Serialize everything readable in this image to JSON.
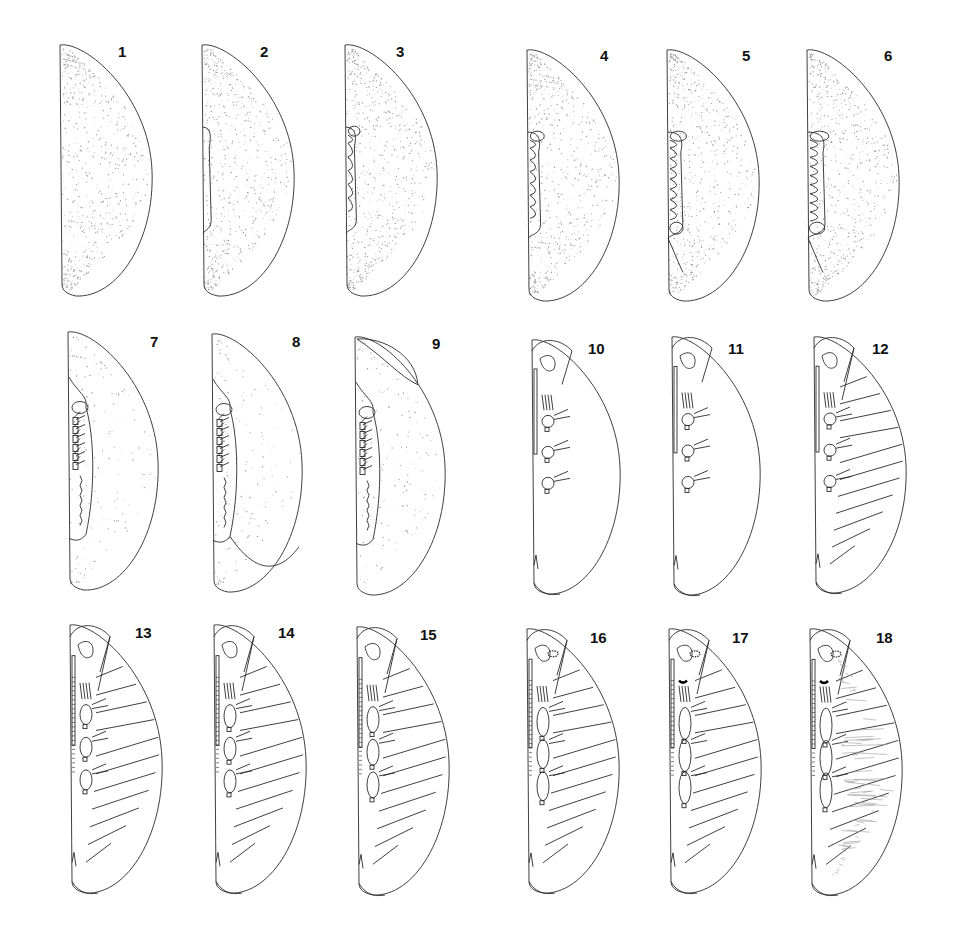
{
  "plate": {
    "description": "Plate of 18 embryonic developmental stages in lateral view",
    "rows": 3,
    "columns": 6,
    "colors": {
      "line": "#2a2a2a",
      "stipple": "#9a9a9a",
      "background": "#ffffff"
    }
  },
  "figures": [
    {
      "label": "1",
      "stage": "egg, uniform yolk",
      "x": 48,
      "y": 43,
      "w": 106,
      "h": 255,
      "type": "egg",
      "band": 0
    },
    {
      "label": "2",
      "stage": "early germ band",
      "x": 190,
      "y": 43,
      "w": 106,
      "h": 255,
      "type": "egg",
      "band": 1
    },
    {
      "label": "3",
      "stage": "segmenting germ band",
      "x": 333,
      "y": 43,
      "w": 106,
      "h": 255,
      "type": "egg",
      "band": 2
    },
    {
      "label": "4",
      "stage": "germ band with segment folds",
      "x": 515,
      "y": 48,
      "w": 106,
      "h": 255,
      "type": "egg",
      "band": 3
    },
    {
      "label": "5",
      "stage": "limb buds appearing",
      "x": 655,
      "y": 48,
      "w": 106,
      "h": 255,
      "type": "egg",
      "band": 4
    },
    {
      "label": "6",
      "stage": "limb buds elongating",
      "x": 795,
      "y": 48,
      "w": 106,
      "h": 255,
      "type": "egg",
      "band": 5
    },
    {
      "label": "7",
      "stage": "appendages forming",
      "x": 56,
      "y": 330,
      "w": 104,
      "h": 262,
      "type": "mid",
      "band": 6
    },
    {
      "label": "8",
      "stage": "appendages segmented",
      "x": 200,
      "y": 332,
      "w": 104,
      "h": 262,
      "type": "mid",
      "band": 7
    },
    {
      "label": "9",
      "stage": "dorsal closure begins",
      "x": 343,
      "y": 335,
      "w": 104,
      "h": 262,
      "type": "mid",
      "band": 8
    },
    {
      "label": "10",
      "stage": "appendages outlined, yolk clear",
      "x": 520,
      "y": 338,
      "w": 102,
      "h": 258,
      "type": "late",
      "band": 9
    },
    {
      "label": "11",
      "stage": "head capsule defined",
      "x": 660,
      "y": 335,
      "w": 102,
      "h": 262,
      "type": "late",
      "band": 10
    },
    {
      "label": "12",
      "stage": "tergites segmented",
      "x": 802,
      "y": 335,
      "w": 106,
      "h": 260,
      "type": "segmented",
      "band": 11
    },
    {
      "label": "13",
      "stage": "antenna segmented",
      "x": 58,
      "y": 623,
      "w": 106,
      "h": 272,
      "type": "segmented",
      "band": 12
    },
    {
      "label": "14",
      "stage": "antenna elongated",
      "x": 202,
      "y": 623,
      "w": 106,
      "h": 272,
      "type": "segmented",
      "band": 13
    },
    {
      "label": "15",
      "stage": "legs elongated",
      "x": 345,
      "y": 625,
      "w": 106,
      "h": 272,
      "type": "segmented",
      "band": 14
    },
    {
      "label": "16",
      "stage": "eye pigment appearing",
      "x": 515,
      "y": 627,
      "w": 106,
      "h": 268,
      "type": "segmented",
      "band": 15
    },
    {
      "label": "17",
      "stage": "eye and mandible pigmented",
      "x": 657,
      "y": 627,
      "w": 106,
      "h": 268,
      "type": "segmented",
      "band": 16
    },
    {
      "label": "18",
      "stage": "pre-hatching, setae visible",
      "x": 798,
      "y": 627,
      "w": 106,
      "h": 270,
      "type": "segmented",
      "band": 17
    }
  ],
  "labels": {
    "1": {
      "x": 118,
      "y": 44
    },
    "2": {
      "x": 260,
      "y": 44
    },
    "3": {
      "x": 396,
      "y": 44
    },
    "4": {
      "x": 600,
      "y": 48
    },
    "5": {
      "x": 742,
      "y": 48
    },
    "6": {
      "x": 884,
      "y": 48
    },
    "7": {
      "x": 150,
      "y": 334
    },
    "8": {
      "x": 292,
      "y": 334
    },
    "9": {
      "x": 432,
      "y": 336
    },
    "10": {
      "x": 588,
      "y": 341
    },
    "11": {
      "x": 728,
      "y": 341
    },
    "12": {
      "x": 872,
      "y": 341
    },
    "13": {
      "x": 135,
      "y": 625
    },
    "14": {
      "x": 278,
      "y": 625
    },
    "15": {
      "x": 420,
      "y": 627
    },
    "16": {
      "x": 590,
      "y": 630
    },
    "17": {
      "x": 732,
      "y": 630
    },
    "18": {
      "x": 876,
      "y": 630
    }
  }
}
